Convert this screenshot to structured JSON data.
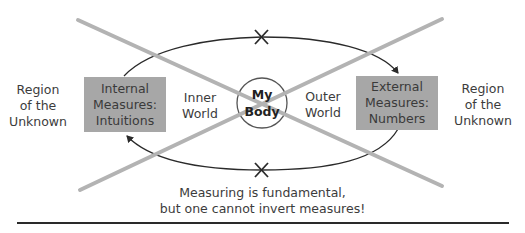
{
  "diagram": {
    "center": {
      "line1": "My",
      "line2": "Body"
    },
    "inner_world": {
      "line1": "Inner",
      "line2": "World"
    },
    "outer_world": {
      "line1": "Outer",
      "line2": "World"
    },
    "internal_box": {
      "line1": "Internal",
      "line2": "Measures:",
      "line3": "Intuitions"
    },
    "external_box": {
      "line1": "External",
      "line2": "Measures:",
      "line3": "Numbers"
    },
    "left_region": {
      "line1": "Region",
      "line2": "of the",
      "line3": "Unknown"
    },
    "right_region": {
      "line1": "Region",
      "line2": "of the",
      "line3": "Unknown"
    },
    "caption": {
      "line1": "Measuring is fundamental,",
      "line2": "but one cannot invert measures!"
    },
    "colors": {
      "box_fill": "#a7a7a7",
      "cross_lines": "#b3b3b3",
      "arrows": "#2a2a2a"
    }
  }
}
